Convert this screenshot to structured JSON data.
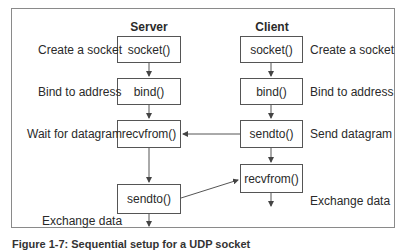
{
  "diagram": {
    "title_server": "Server",
    "title_client": "Client",
    "server": {
      "boxes": [
        "socket()",
        "bind()",
        "recvfrom()",
        "sendto()"
      ],
      "labels": [
        "Create a socket",
        "Bind to address",
        "Wait for datagram",
        "Exchange data"
      ]
    },
    "client": {
      "boxes": [
        "socket()",
        "bind()",
        "sendto()",
        "recvfrom()"
      ],
      "labels": [
        "Create a socket",
        "Bind to address",
        "Send datagram",
        "Exchange data"
      ]
    },
    "edges": [
      {
        "from": "server.socket()",
        "to": "server.bind()"
      },
      {
        "from": "server.bind()",
        "to": "server.recvfrom()"
      },
      {
        "from": "server.recvfrom()",
        "to": "server.sendto()"
      },
      {
        "from": "client.socket()",
        "to": "client.bind()"
      },
      {
        "from": "client.bind()",
        "to": "client.sendto()"
      },
      {
        "from": "client.sendto()",
        "to": "client.recvfrom()"
      },
      {
        "from": "client.sendto()",
        "to": "server.recvfrom()"
      },
      {
        "from": "server.sendto()",
        "to": "client.recvfrom()"
      }
    ],
    "caption": "Figure 1-7: Sequential setup for a UDP socket"
  }
}
